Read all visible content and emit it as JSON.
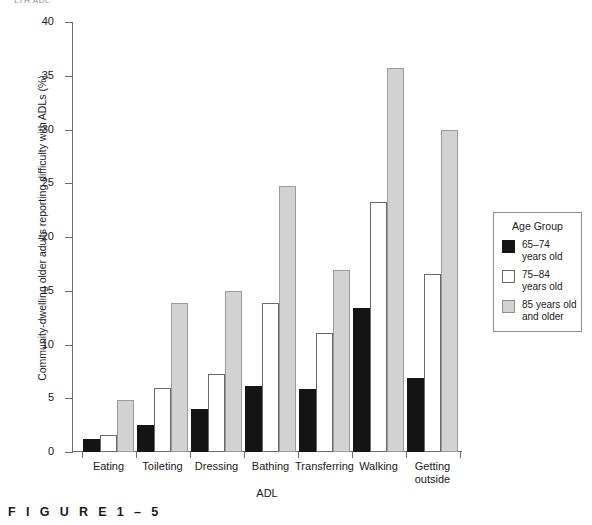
{
  "running_head": "LTH  ADL",
  "figure_caption": "F I G U R E   1 – 5",
  "legend": {
    "title": "Age Group",
    "items": [
      {
        "label": "65–74\nyears old",
        "line1": "65–74",
        "line2": "years old",
        "color": "#141414"
      },
      {
        "label": "75–84\nyears old",
        "line1": "75–84",
        "line2": "years old",
        "color": "#ffffff"
      },
      {
        "label": "85 years old\nand older",
        "line1": "85 years old",
        "line2": "and older",
        "color": "#d2d2d2"
      }
    ]
  },
  "chart_data": {
    "type": "bar",
    "title": "",
    "xlabel": "ADL",
    "ylabel": "Community-dwelling older adults reporting difficulty with ADLs (%)",
    "categories": [
      "Eating",
      "Toileting",
      "Dressing",
      "Bathing",
      "Transferring",
      "Walking",
      "Getting outside"
    ],
    "category_lines": [
      [
        "Eating"
      ],
      [
        "Toileting"
      ],
      [
        "Dressing"
      ],
      [
        "Bathing"
      ],
      [
        "Transferring"
      ],
      [
        "Walking"
      ],
      [
        "Getting",
        "outside"
      ]
    ],
    "series": [
      {
        "name": "65–74 years old",
        "color": "#141414",
        "values": [
          1.2,
          2.5,
          4.0,
          6.1,
          5.9,
          13.4,
          6.9
        ]
      },
      {
        "name": "75–84 years old",
        "color": "#ffffff",
        "values": [
          1.6,
          6.0,
          7.3,
          13.9,
          11.1,
          23.3,
          16.6
        ]
      },
      {
        "name": "85 years old and older",
        "color": "#d2d2d2",
        "values": [
          4.8,
          13.9,
          15.0,
          24.7,
          16.9,
          35.7,
          30.0
        ]
      }
    ],
    "ylim": [
      0,
      40
    ],
    "yticks": [
      0,
      5,
      10,
      15,
      20,
      25,
      30,
      35,
      40
    ],
    "grid": false,
    "legend_position": "right"
  }
}
